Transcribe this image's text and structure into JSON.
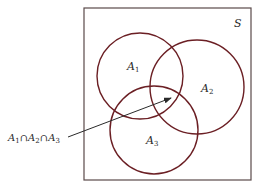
{
  "diagram": {
    "type": "venn",
    "universe": {
      "label": "S",
      "box": {
        "x": 84,
        "y": 8,
        "width": 167,
        "height": 172
      },
      "label_pos": {
        "x": 234,
        "y": 27
      },
      "stroke": "#5a4a4a"
    },
    "sets": [
      {
        "name": "A1",
        "base": "A",
        "subscript": "1",
        "cx": 140,
        "cy": 76,
        "r": 43,
        "label_pos": {
          "x": 127,
          "y": 70
        }
      },
      {
        "name": "A2",
        "base": "A",
        "subscript": "2",
        "cx": 197,
        "cy": 87,
        "r": 47,
        "label_pos": {
          "x": 201,
          "y": 92
        }
      },
      {
        "name": "A3",
        "base": "A",
        "subscript": "3",
        "cx": 154,
        "cy": 130,
        "r": 44,
        "label_pos": {
          "x": 146,
          "y": 144
        }
      }
    ],
    "circle_stroke": "#6b1f24",
    "annotation": {
      "label_parts": [
        {
          "base": "A",
          "sub": "1"
        },
        {
          "op": "∩"
        },
        {
          "base": "A",
          "sub": "2"
        },
        {
          "op": "∩"
        },
        {
          "base": "A",
          "sub": "3"
        }
      ],
      "label_text": "A1 ∩ A2 ∩ A3",
      "label_pos": {
        "x": 8,
        "y": 141
      },
      "arrow": {
        "x1": 68,
        "y1": 137,
        "x2": 171,
        "y2": 98
      },
      "arrow_color": "#2a2a2a"
    }
  }
}
